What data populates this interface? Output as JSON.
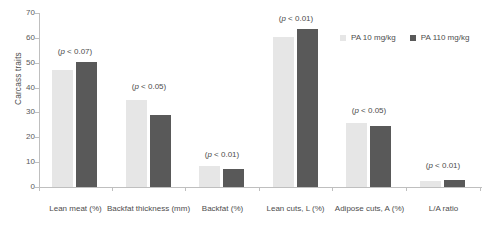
{
  "chart_data": {
    "type": "bar",
    "title": "",
    "xlabel": "",
    "ylabel": "Carcass traits",
    "ylim": [
      0,
      70
    ],
    "yticks": [
      "0",
      "10",
      "20",
      "30",
      "40",
      "50",
      "60",
      "70"
    ],
    "grid": false,
    "legend_position": "top-right",
    "categories": [
      "Lean meat (%)",
      "Backfat thickness (mm)",
      "Backfat (%)",
      "Lean cuts, L (%)",
      "Adipose cuts, A (%)",
      "L/A ratio"
    ],
    "annotations": [
      "(p < 0.07)",
      "(p < 0.05)",
      "(p < 0.01)",
      "(p < 0.01)",
      "(p < 0.05)",
      "(p < 0.01)"
    ],
    "series": [
      {
        "name": "PA 10 mg/kg",
        "color": "#e6e6e6",
        "values": [
          47.0,
          35.2,
          8.3,
          60.2,
          25.8,
          2.4
        ]
      },
      {
        "name": "PA 110 mg/kg",
        "color": "#595959",
        "values": [
          50.3,
          28.8,
          7.3,
          63.4,
          24.5,
          2.7
        ]
      }
    ]
  },
  "legend": {
    "items": [
      {
        "label": "PA 10 mg/kg"
      },
      {
        "label": "PA 110 mg/kg"
      }
    ]
  }
}
